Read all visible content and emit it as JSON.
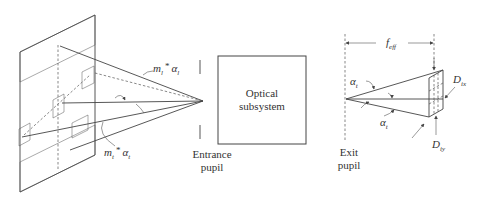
{
  "diagram": {
    "type": "optical-system-schematic",
    "labels": {
      "angle_long": {
        "m": "m",
        "m_sub": "l",
        "star": "*",
        "a": "α",
        "a_sub": "l"
      },
      "angle_trans": {
        "m": "m",
        "m_sub": "t",
        "star": "*",
        "a": "α",
        "a_sub": "t"
      },
      "entrance_pupil": [
        "Entrance",
        "pupil"
      ],
      "optical_subsystem": [
        "Optical",
        "subsystem"
      ],
      "exit_pupil": [
        "Exit",
        "pupil"
      ],
      "focal_length": {
        "f": "f",
        "sub": "eff"
      },
      "alpha_upper": {
        "a": "α",
        "sub": "t"
      },
      "alpha_lower": {
        "a": "α",
        "sub": "t"
      },
      "detector_x": {
        "d": "D",
        "sub": "ix"
      },
      "detector_y": {
        "d": "D",
        "sub": "iy"
      }
    },
    "colors": {
      "line": "#444444",
      "text": "#333333",
      "background": "#ffffff"
    }
  }
}
